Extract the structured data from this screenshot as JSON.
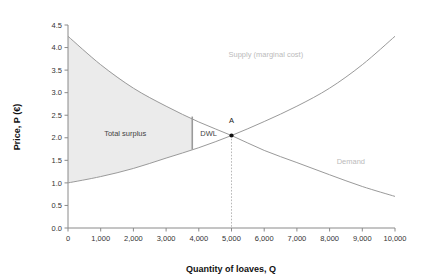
{
  "chart_data": {
    "type": "line",
    "title": "",
    "subtitle": "",
    "xlabel": "Quantity of loaves, Q",
    "ylabel": "Price, P (€)",
    "xlim": [
      0,
      10000
    ],
    "ylim": [
      0.0,
      4.5
    ],
    "grid": false,
    "legend_position": "inline-curve-labels",
    "x_ticks": [
      {
        "value": 0,
        "label": "0"
      },
      {
        "value": 1000,
        "label": "1,000"
      },
      {
        "value": 2000,
        "label": "2,000"
      },
      {
        "value": 3000,
        "label": "3,000"
      },
      {
        "value": 4000,
        "label": "4,000"
      },
      {
        "value": 5000,
        "label": "5,000"
      },
      {
        "value": 6000,
        "label": "6,000"
      },
      {
        "value": 7000,
        "label": "7,000"
      },
      {
        "value": 8000,
        "label": "8,000"
      },
      {
        "value": 9000,
        "label": "9,000"
      },
      {
        "value": 10000,
        "label": "10,000"
      }
    ],
    "y_ticks": [
      {
        "value": 0.0,
        "label": "0.0"
      },
      {
        "value": 0.5,
        "label": "0.5"
      },
      {
        "value": 1.0,
        "label": "1.0"
      },
      {
        "value": 1.5,
        "label": "1.5"
      },
      {
        "value": 2.0,
        "label": "2.0"
      },
      {
        "value": 2.5,
        "label": "2.5"
      },
      {
        "value": 3.0,
        "label": "3.0"
      },
      {
        "value": 3.5,
        "label": "3.5"
      },
      {
        "value": 4.0,
        "label": "4.0"
      },
      {
        "value": 4.5,
        "label": "4.5"
      }
    ],
    "series": [
      {
        "name": "Supply (marginal cost)",
        "label": "Supply (marginal cost)",
        "color": "#9a9a9a",
        "x": [
          0,
          1000,
          2000,
          3000,
          4000,
          5000,
          6000,
          7000,
          8000,
          9000,
          10000
        ],
        "values": [
          1.0,
          1.14,
          1.32,
          1.55,
          1.78,
          2.05,
          2.36,
          2.7,
          3.1,
          3.62,
          4.25
        ]
      },
      {
        "name": "Demand",
        "label": "Demand",
        "color": "#9a9a9a",
        "x": [
          0,
          1000,
          2000,
          3000,
          4000,
          5000,
          6000,
          7000,
          8000,
          9000,
          10000
        ],
        "values": [
          4.25,
          3.62,
          3.1,
          2.7,
          2.35,
          2.05,
          1.72,
          1.45,
          1.18,
          0.92,
          0.7
        ]
      }
    ],
    "annotations": [
      {
        "name": "total-surplus-region",
        "label": "Total surplus",
        "type": "shaded-area",
        "fill": "#ebebeb",
        "x_range": [
          0,
          3800
        ],
        "label_at": {
          "x": 1750,
          "y": 2.05
        }
      },
      {
        "name": "dwl-region",
        "label": "DWL",
        "type": "text",
        "label_at": {
          "x": 4300,
          "y": 2.05
        }
      },
      {
        "name": "equilibrium-point",
        "label": "A",
        "type": "point",
        "x": 5000,
        "y": 2.05,
        "label_at": {
          "x": 5000,
          "y": 2.33
        },
        "dropline_to_y": 0.0
      },
      {
        "name": "dwl-divider-line",
        "label": "",
        "type": "vertical-segment",
        "x": 3800,
        "y_from": 1.74,
        "y_to": 2.47
      },
      {
        "name": "supply-curve-label",
        "label": "Supply (marginal cost)",
        "type": "curve-label",
        "label_at": {
          "x": 6050,
          "y": 3.78
        }
      },
      {
        "name": "demand-curve-label",
        "label": "Demand",
        "type": "curve-label",
        "label_at": {
          "x": 8650,
          "y": 1.42
        }
      }
    ]
  }
}
